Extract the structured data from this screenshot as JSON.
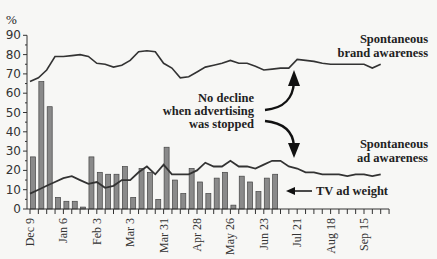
{
  "chart_data": {
    "type": "bar+line",
    "title": "",
    "ylabel": "%",
    "xlabel": "",
    "ylim": [
      0,
      90
    ],
    "yticks": [
      0,
      10,
      20,
      30,
      40,
      50,
      60,
      70,
      80,
      90
    ],
    "grid": false,
    "x_tick_labels": [
      "Dec 9",
      "Jan 6",
      "Feb 3",
      "Mar 3",
      "Mar 31",
      "Apr 28",
      "May 26",
      "Jun 23",
      "Jul 21",
      "Aug 18",
      "Sep 15"
    ],
    "x_tick_label_week_index": [
      0,
      4,
      8,
      12,
      16,
      20,
      24,
      28,
      32,
      36,
      40
    ],
    "weeks_total": 44,
    "series": [
      {
        "name": "TV ad weight",
        "kind": "bar",
        "color": "#8a8a8a",
        "values": [
          27,
          66,
          53,
          6,
          4,
          4,
          1,
          27,
          19,
          18,
          18,
          22,
          6,
          21,
          19,
          5,
          32,
          15,
          8,
          21,
          14,
          8,
          16,
          19,
          2,
          17,
          14,
          9,
          16,
          18
        ]
      },
      {
        "name": "Spontaneous brand awareness",
        "kind": "line",
        "color": "#333333",
        "values": [
          66,
          68,
          72,
          79,
          79,
          79.5,
          80,
          79,
          75.5,
          75,
          73.5,
          74.5,
          77,
          81.5,
          82,
          81.5,
          75.5,
          73,
          68,
          68.5,
          71,
          73.5,
          74.5,
          75.5,
          77,
          75.5,
          75.5,
          74,
          72,
          72.5,
          73,
          73,
          77.5,
          77,
          76.5,
          75.5,
          75,
          75,
          75,
          75,
          75,
          73,
          75
        ]
      },
      {
        "name": "Spontaneous ad awareness",
        "kind": "line",
        "color": "#333333",
        "values": [
          8,
          10,
          12,
          14,
          16,
          17,
          15,
          13,
          14,
          11,
          12,
          15,
          15,
          19,
          22,
          18,
          23,
          18,
          18,
          18,
          20,
          24,
          22,
          22,
          25,
          22,
          22,
          21,
          23,
          25,
          25,
          22,
          21,
          19,
          19,
          18,
          18,
          18,
          17,
          18,
          18,
          17,
          18
        ]
      }
    ],
    "annotations": [
      {
        "text": "Spontaneous brand awareness",
        "lines": [
          "Spontaneous",
          "brand awareness"
        ]
      },
      {
        "text": "Spontaneous ad awareness",
        "lines": [
          "Spontaneous",
          "ad awareness"
        ]
      },
      {
        "text": "No decline when advertising was stopped",
        "lines": [
          "No decline",
          "when advertising",
          "was stopped"
        ]
      },
      {
        "text": "TV ad weight",
        "lines": [
          "TV ad weight"
        ]
      }
    ],
    "legend": "none (inline annotations)"
  },
  "labels": {
    "y_unit": "%",
    "brand_line1": "Spontaneous",
    "brand_line2": "brand awareness",
    "ad_line1": "Spontaneous",
    "ad_line2": "ad awareness",
    "note_line1": "No decline",
    "note_line2": "when advertising",
    "note_line3": "was stopped",
    "tv_label": "TV ad weight"
  }
}
